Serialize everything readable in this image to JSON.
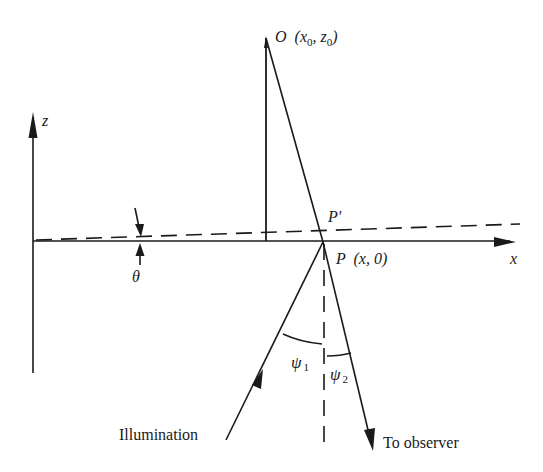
{
  "diagram": {
    "type": "geometry",
    "colors": {
      "ink": "#1a1a1a",
      "background": "#ffffff"
    },
    "labels": {
      "z_axis": "z",
      "x_axis": "x",
      "object_point": {
        "name": "O",
        "coords": "(x",
        "sub0": "0",
        "sep": ", z",
        "sub1": "0",
        "close": ")"
      },
      "p_prime": "P′",
      "point_p": {
        "name": "P",
        "coords": "(x, 0)"
      },
      "theta": "θ",
      "psi1": {
        "sym": "ψ",
        "sub": "1"
      },
      "psi2": {
        "sym": "ψ",
        "sub": "2"
      },
      "illumination": "Illumination",
      "to_observer": "To observer"
    }
  }
}
